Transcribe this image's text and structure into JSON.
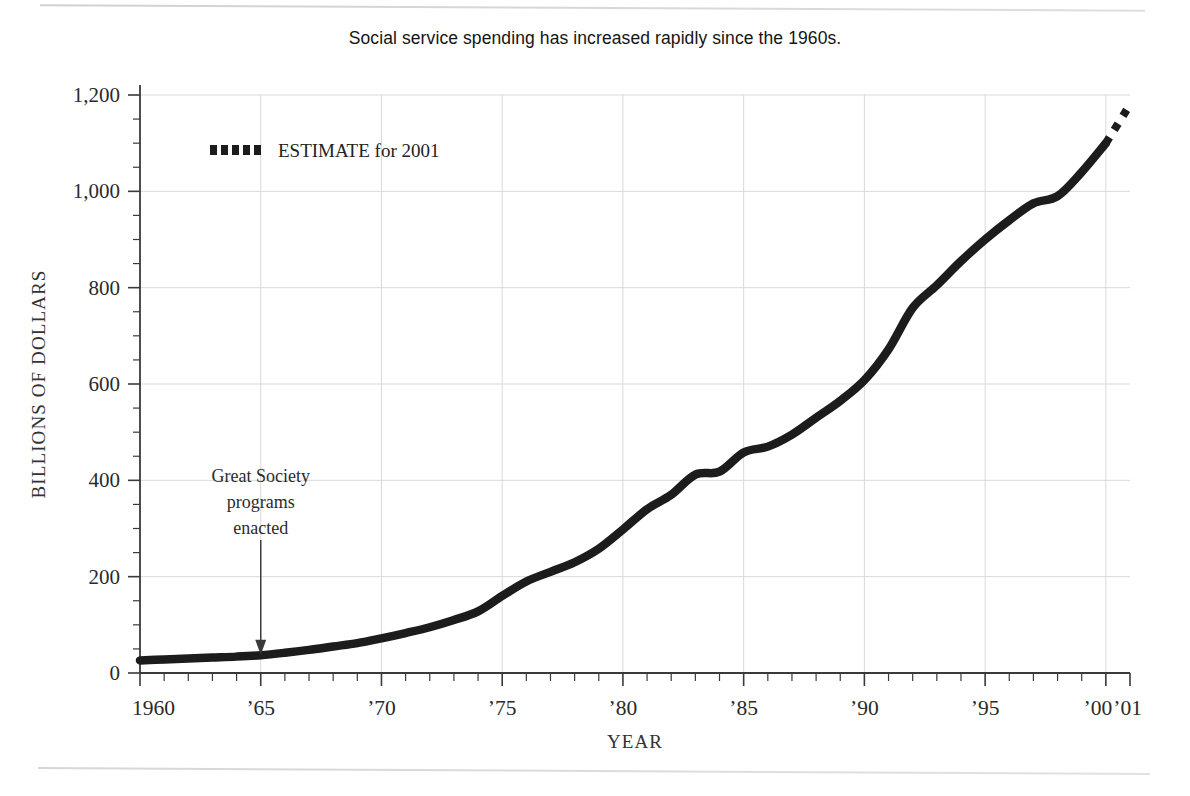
{
  "chart_data": {
    "type": "line",
    "title": "Social service spending has increased rapidly since the 1960s.",
    "xlabel": "YEAR",
    "ylabel": "BILLIONS OF DOLLARS",
    "xlim": [
      1960,
      2001
    ],
    "ylim": [
      0,
      1200
    ],
    "grid": true,
    "y_ticks": [
      0,
      200,
      400,
      600,
      800,
      1000,
      1200
    ],
    "y_tick_labels": [
      "0",
      "200",
      "400",
      "600",
      "800",
      "1,000",
      "1,200"
    ],
    "y_minor_tick_step": 50,
    "x_ticks": [
      1960,
      1965,
      1970,
      1975,
      1980,
      1985,
      1990,
      1995,
      2000,
      2001
    ],
    "x_tick_labels": [
      "1960",
      "’65",
      "’70",
      "’75",
      "’80",
      "’85",
      "’90",
      "’95",
      "’00",
      "’01"
    ],
    "x_minor_tick_step": 1,
    "legend": {
      "position": "inside-top-left",
      "entries": [
        {
          "label": "ESTIMATE for 2001",
          "style": "dotted",
          "color": "#1c1c1c"
        }
      ]
    },
    "annotations": [
      {
        "text_lines": [
          "Great Society",
          "programs",
          "enacted"
        ],
        "x": 1965,
        "y_value": 40,
        "arrow": "down"
      }
    ],
    "series": [
      {
        "name": "Social service spending",
        "style": "solid",
        "color": "#1c1c1c",
        "x": [
          1960,
          1961,
          1962,
          1963,
          1964,
          1965,
          1966,
          1967,
          1968,
          1969,
          1970,
          1971,
          1972,
          1973,
          1974,
          1975,
          1976,
          1977,
          1978,
          1979,
          1980,
          1981,
          1982,
          1983,
          1984,
          1985,
          1986,
          1987,
          1988,
          1989,
          1990,
          1991,
          1992,
          1993,
          1994,
          1995,
          1996,
          1997,
          1998,
          1999,
          2000
        ],
        "values": [
          26,
          28,
          30,
          32,
          34,
          37,
          42,
          48,
          55,
          62,
          72,
          83,
          95,
          110,
          128,
          160,
          190,
          210,
          230,
          258,
          298,
          340,
          370,
          412,
          418,
          458,
          470,
          495,
          530,
          565,
          608,
          672,
          758,
          805,
          855,
          900,
          940,
          975,
          990,
          1040,
          1100
        ]
      },
      {
        "name": "ESTIMATE for 2001",
        "style": "dotted",
        "color": "#1c1c1c",
        "x": [
          2000,
          2001
        ],
        "values": [
          1100,
          1180
        ]
      }
    ]
  }
}
